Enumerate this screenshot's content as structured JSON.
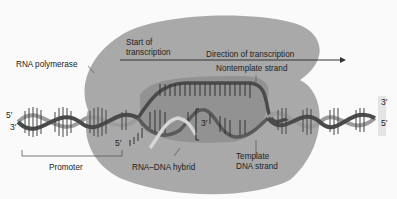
{
  "diagram": {
    "labels": {
      "rna_polymerase": "RNA polymerase",
      "start_line1": "Start of",
      "start_line2": "transcription",
      "direction": "Direction of transcription",
      "nontemplate": "Nontemplate strand",
      "promoter": "Promoter",
      "hybrid": "RNA–DNA hybrid",
      "template_line1": "Template",
      "template_line2": "DNA strand"
    },
    "ends": {
      "left_top": "5′",
      "left_bottom": "3′",
      "right_top": "3′",
      "right_bottom": "5′",
      "rna_5": "5′",
      "rna_3": "3′"
    },
    "colors": {
      "polymerase": "#a9a9a9",
      "bubble": "#8f8f8f",
      "strand_dark": "#4a4a4a",
      "strand_light": "#9c9c9c",
      "rna": "#d6d6d6",
      "text": "#222222",
      "background": "#fafafa"
    }
  }
}
